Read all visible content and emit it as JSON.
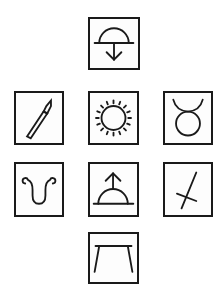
{
  "puzzle": {
    "tiles": [
      {
        "id": "top",
        "symbol": "semicircle-on-line-arrow-down-icon"
      },
      {
        "id": "middle-left",
        "symbol": "paintbrush-icon"
      },
      {
        "id": "center",
        "symbol": "sun-icon"
      },
      {
        "id": "middle-right",
        "symbol": "taurus-icon"
      },
      {
        "id": "lower-left",
        "symbol": "curled-u-icon"
      },
      {
        "id": "lower-center",
        "symbol": "semicircle-on-line-arrow-up-icon"
      },
      {
        "id": "lower-right",
        "symbol": "crossed-line-icon"
      },
      {
        "id": "bottom",
        "symbol": "table-icon"
      }
    ],
    "colors": {
      "stroke": "#1a1a1a",
      "background": "#ffffff"
    }
  }
}
